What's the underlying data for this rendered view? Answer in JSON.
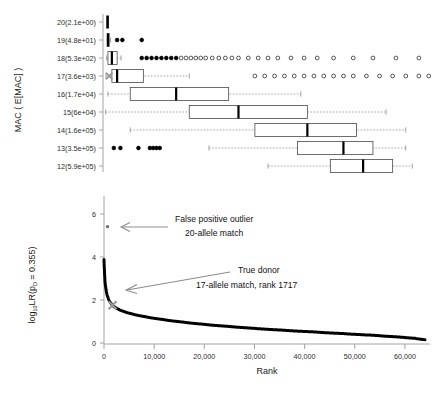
{
  "figure": {
    "title": "",
    "background": "#ffffff",
    "panels": [
      "mac-boxplot-panel",
      "rank-lr-panel"
    ]
  },
  "top_panel": {
    "y_axis_title": "MAC ( E[MAC] )",
    "y_tick_labels": [
      "20(2.1e+00)",
      "19(4.8e+01)",
      "18(5.3e+02)",
      "17(3.6e+03)",
      "16(1.7e+04)",
      "15(6e+04)",
      "14(1.6e+05)",
      "13(3.5e+05)",
      "12(5.9e+05)"
    ],
    "marker_color": "#9a9a9a",
    "box_color": "#000000"
  },
  "bottom_panel": {
    "y_axis_title_main": "log",
    "y_axis_title_sub": "10",
    "y_axis_title_rest": "LR(p",
    "y_axis_title_sub2": "D",
    "y_axis_title_end": " = 0.355)",
    "y_axis_title_full": "log10LR(pD = 0.355)",
    "x_axis_title": "Rank",
    "y_tick_labels": [
      "0",
      "2",
      "4",
      "6"
    ],
    "x_tick_labels": [
      "0",
      "10,000",
      "20,000",
      "30,000",
      "40,000",
      "50,000",
      "60,000"
    ],
    "curve_color": "#000000",
    "marker_color": "#9a9a9a"
  },
  "annotations": {
    "false_positive": {
      "line1": "False positive outlier",
      "line2": "20-allele match",
      "arrow": "left-arrow-icon",
      "arrow_color": "#8d8d8d"
    },
    "true_donor": {
      "line1": "True donor",
      "line2": "17-allele match, rank 1717",
      "arrow": "diagonal-arrow-icon",
      "arrow_color": "#8d8d8d"
    }
  },
  "chart_data": [
    {
      "type": "box",
      "name": "mac-distribution-boxplot",
      "title": "",
      "xlabel": "",
      "ylabel": "MAC ( E[MAC] )",
      "grid": false,
      "orientation": "horizontal",
      "categories": [
        "20(2.1e+00)",
        "19(4.8e+01)",
        "18(5.3e+02)",
        "17(3.6e+03)",
        "16(1.7e+04)",
        "15(6e+04)",
        "14(1.6e+05)",
        "13(3.5e+05)",
        "12(5.9e+05)"
      ],
      "xlim": [
        0,
        100
      ],
      "boxes": [
        {
          "category": "20(2.1e+00)",
          "min": 1.0,
          "q1": 1.0,
          "median": 1.0,
          "q3": 1.2,
          "max": 1.2,
          "outliers": [],
          "degenerate": true
        },
        {
          "category": "19(4.8e+01)",
          "min": 1.0,
          "q1": 1.0,
          "median": 1.2,
          "q3": 1.6,
          "max": 2.0,
          "outliers": [
            4.0,
            5.6,
            11.5
          ],
          "degenerate": true
        },
        {
          "category": "18(5.3e+02)",
          "min": 0.8,
          "q1": 1.2,
          "median": 2.4,
          "q3": 4.0,
          "max": 5.2,
          "outliers": [
            11.5,
            13.0,
            14.5,
            16.0,
            17.5,
            19.0,
            20.5,
            22.0,
            23.5,
            25.0,
            26.5,
            28.0,
            29.5,
            31.0,
            33.0,
            35.0,
            37.0,
            39.0,
            41.0,
            44.0,
            47.0,
            50.0,
            53.0,
            57.0,
            61.0,
            65.0,
            70.0,
            76.0,
            82.0,
            89.0,
            96.0
          ],
          "degenerate": false
        },
        {
          "category": "17(3.6e+03)",
          "min": 0.6,
          "q1": 2.4,
          "median": 4.0,
          "q3": 12.0,
          "max": 26.0,
          "outliers": [
            46.0,
            49.0,
            52.0,
            55.0,
            58.0,
            61.0,
            64.0,
            67.0,
            70.0,
            73.0,
            76.0,
            80.0,
            84.0,
            88.0,
            92.0,
            96.0,
            99.0
          ],
          "marker_value": 1.6,
          "degenerate": false
        },
        {
          "category": "16(1.7e+04)",
          "min": 1.2,
          "q1": 8.0,
          "median": 22.0,
          "q3": 38.0,
          "max": 60.0,
          "outliers": [],
          "degenerate": false
        },
        {
          "category": "15(6e+04)",
          "min": 0.5,
          "q1": 26.0,
          "median": 41.0,
          "q3": 62.0,
          "max": 86.0,
          "outliers": [],
          "degenerate": false
        },
        {
          "category": "14(1.6e+05)",
          "min": 8.0,
          "q1": 46.0,
          "median": 62.0,
          "q3": 77.0,
          "max": 92.0,
          "outliers": [],
          "degenerate": false
        },
        {
          "category": "13(3.5e+05)",
          "min": 32.0,
          "q1": 59.0,
          "median": 73.0,
          "q3": 82.0,
          "max": 92.0,
          "outliers": [
            3.0,
            5.0,
            10.5,
            14.0,
            15.0,
            16.0,
            17.0
          ],
          "degenerate": false
        },
        {
          "category": "12(5.9e+05)",
          "min": 50.0,
          "q1": 69.0,
          "median": 79.0,
          "q3": 88.0,
          "max": 94.0,
          "outliers": [],
          "degenerate": false
        }
      ]
    },
    {
      "type": "line",
      "name": "rank-vs-log10lr-curve",
      "title": "",
      "xlabel": "Rank",
      "ylabel": "log10LR(pD = 0.355)",
      "grid": false,
      "xlim": [
        0,
        65000
      ],
      "ylim": [
        0,
        7
      ],
      "xticks": [
        0,
        10000,
        20000,
        30000,
        40000,
        50000,
        60000
      ],
      "yticks": [
        0,
        2,
        4,
        6
      ],
      "series": [
        {
          "name": "ranked-log10LR",
          "x": [
            0,
            200,
            500,
            900,
            1400,
            1717,
            2200,
            3000,
            4200,
            6000,
            8500,
            12000,
            16000,
            20000,
            25000,
            30000,
            36000,
            42000,
            48000,
            54000,
            59000,
            62000,
            64000
          ],
          "values": [
            4.0,
            2.95,
            2.45,
            2.12,
            1.92,
            1.83,
            1.74,
            1.63,
            1.52,
            1.4,
            1.28,
            1.15,
            1.03,
            0.93,
            0.83,
            0.74,
            0.65,
            0.57,
            0.49,
            0.41,
            0.33,
            0.27,
            0.2
          ]
        }
      ],
      "points": [
        {
          "name": "false-positive-outlier",
          "x": 700,
          "y": 5.55,
          "label": "False positive outlier / 20-allele match",
          "color": "#6f6f6f"
        },
        {
          "name": "true-donor-marker",
          "x": 1717,
          "y": 1.83,
          "label": "True donor / 17-allele match, rank 1717",
          "color": "#9a9a9a"
        }
      ]
    }
  ]
}
